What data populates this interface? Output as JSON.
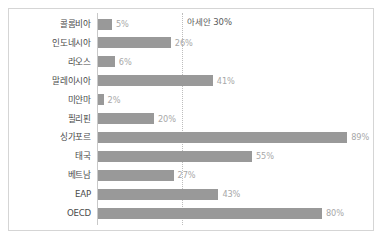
{
  "chart_data": {
    "type": "bar",
    "orientation": "horizontal",
    "title": "",
    "xlabel": "",
    "ylabel": "",
    "xlim": [
      0,
      100
    ],
    "grid": false,
    "legend": null,
    "categories": [
      "콜롬비아",
      "인도네시아",
      "라오스",
      "말레이시아",
      "미얀마",
      "필리핀",
      "싱가포르",
      "태국",
      "베트남",
      "EAP",
      "OECD"
    ],
    "values": [
      5,
      26,
      6,
      41,
      2,
      20,
      89,
      55,
      27,
      43,
      80
    ],
    "value_labels": [
      "5%",
      "26%",
      "6%",
      "41%",
      "2%",
      "20%",
      "89%",
      "55%",
      "27%",
      "43%",
      "80%"
    ],
    "annotations": [
      {
        "name": "asean-reference",
        "label": "아세안 30%",
        "value": 30,
        "style": "dotted-vertical-line"
      }
    ],
    "colors": {
      "bar": "#999999",
      "value_label": "#a8a8a8",
      "category_label": "#4a4a4a",
      "annotation_text": "#5b5b5b",
      "reference_line": "#bdbdbd",
      "axis_line": "#c9c9c9",
      "frame_border": "#d5d5d5",
      "background": "#ffffff"
    }
  }
}
